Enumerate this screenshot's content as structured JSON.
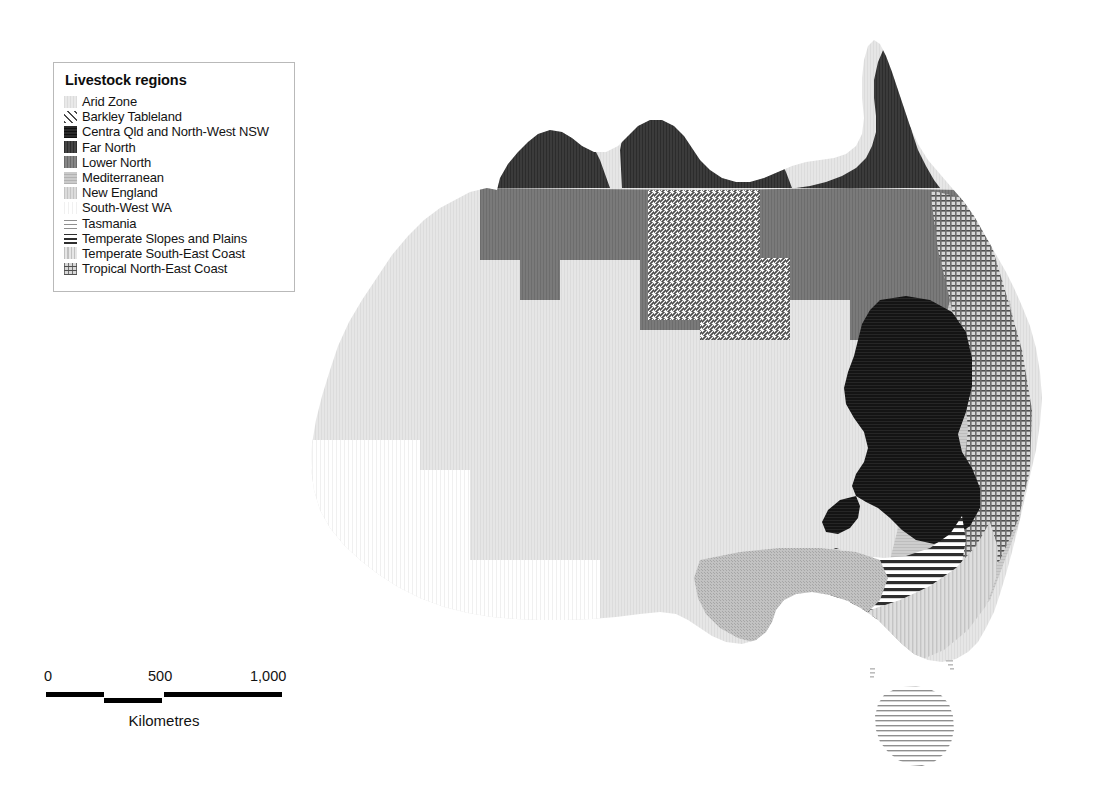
{
  "legend": {
    "title": "Livestock regions",
    "items": [
      {
        "label": "Arid Zone",
        "pattern": "solid-light",
        "color": "#e3e3e3"
      },
      {
        "label": "Barkley Tableland",
        "pattern": "diagonal-hatch",
        "color": "#8a8a8a"
      },
      {
        "label": "Centra Qld and North-West NSW",
        "pattern": "solid-black",
        "color": "#1a1a1a"
      },
      {
        "label": "Far North",
        "pattern": "solid-dark",
        "color": "#3c3c3c"
      },
      {
        "label": "Lower North",
        "pattern": "solid-mid-dark",
        "color": "#767676"
      },
      {
        "label": "Mediterranean",
        "pattern": "solid-mid",
        "color": "#bcbcbc"
      },
      {
        "label": "New England",
        "pattern": "solid-mid-light",
        "color": "#cfcfcf"
      },
      {
        "label": "South-West WA",
        "pattern": "vertical-very-faint",
        "color": "#f4f4f4"
      },
      {
        "label": "Tasmania",
        "pattern": "horizontal-lines",
        "color": "#9a9a9a"
      },
      {
        "label": "Temperate Slopes and Plains",
        "pattern": "horizontal-bold",
        "color": "#4a4a4a"
      },
      {
        "label": "Temperate South-East Coast",
        "pattern": "vertical-light",
        "color": "#d2d2d2"
      },
      {
        "label": "Tropical North-East Coast",
        "pattern": "cross-hatch",
        "color": "#8e8e8e"
      }
    ]
  },
  "scalebar": {
    "caption": "Kilometres",
    "ticks": [
      {
        "label": "0",
        "x": 0
      },
      {
        "label": "500",
        "x": 120
      },
      {
        "label": "1,000",
        "x": 240
      }
    ],
    "segments": [
      {
        "x": 2,
        "width": 58,
        "y": 0
      },
      {
        "x": 60,
        "width": 58,
        "y": 5
      },
      {
        "x": 120,
        "width": 118,
        "y": 0
      }
    ]
  },
  "map": {
    "title": "Australia livestock regions map",
    "regions": [
      {
        "name": "arid-zone",
        "legend_index": 0
      },
      {
        "name": "barkley-tableland",
        "legend_index": 1
      },
      {
        "name": "central-qld-north-west-nsw",
        "legend_index": 2
      },
      {
        "name": "far-north",
        "legend_index": 3
      },
      {
        "name": "lower-north",
        "legend_index": 4
      },
      {
        "name": "mediterranean",
        "legend_index": 5
      },
      {
        "name": "new-england",
        "legend_index": 6
      },
      {
        "name": "south-west-wa",
        "legend_index": 7
      },
      {
        "name": "tasmania",
        "legend_index": 8
      },
      {
        "name": "temperate-slopes-and-plains",
        "legend_index": 9
      },
      {
        "name": "temperate-south-east-coast",
        "legend_index": 10
      },
      {
        "name": "tropical-north-east-coast",
        "legend_index": 11
      }
    ]
  }
}
